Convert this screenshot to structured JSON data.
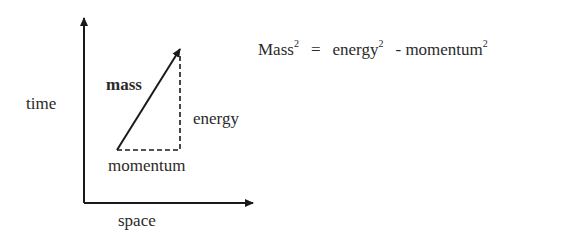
{
  "diagram": {
    "axes": {
      "y_label": "time",
      "x_label": "space"
    },
    "vectors": {
      "mass_label": "mass",
      "energy_label": "energy",
      "momentum_label": "momentum"
    },
    "equation": {
      "lhs": "Mass",
      "lhs_exp": "2",
      "equals": "=",
      "term1": "energy",
      "term1_exp": "2",
      "minus": "-",
      "term2": "momentum",
      "term2_exp": "2"
    },
    "colors": {
      "line": "#1a1a1a",
      "text": "#2a2a2a"
    }
  }
}
